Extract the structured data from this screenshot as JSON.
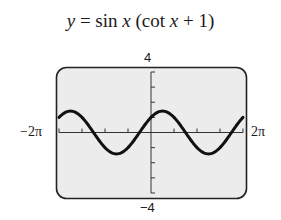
{
  "chart_data": {
    "type": "line",
    "title": "y = sin x (cot x + 1)",
    "title_parts": {
      "y": "y",
      "eq": " = sin ",
      "x1": "x",
      "mid": " (cot ",
      "x2": "x",
      "end": " + 1)"
    },
    "xlabel": "",
    "ylabel": "",
    "xlim": [
      -6.2832,
      6.2832
    ],
    "ylim": [
      -4,
      4
    ],
    "x_tick_labels": {
      "min": "−2π",
      "max": "2π"
    },
    "y_tick_labels": {
      "max": "4",
      "min": "−4"
    },
    "x_tick_spacing": "π/2",
    "y_tick_spacing": 1,
    "grid": false,
    "legend": null,
    "series": [
      {
        "name": "sin x (cot x + 1)",
        "equivalent": "sin x + cos x",
        "x": [
          -6.2832,
          -5.4978,
          -4.7124,
          -3.927,
          -3.1416,
          -2.3562,
          -1.5708,
          -0.7854,
          0,
          0.7854,
          1.5708,
          2.3562,
          3.1416,
          3.927,
          4.7124,
          5.4978,
          6.2832
        ],
        "values": [
          1,
          1.414,
          1,
          0,
          -1,
          -1.414,
          -1,
          0,
          1,
          1.414,
          1,
          0,
          -1,
          -1.414,
          -1,
          0,
          1
        ]
      }
    ],
    "colors": {
      "curve": "#111111",
      "screen_bg": "#ececec",
      "frame": "#222222",
      "axes": "#333333"
    }
  }
}
